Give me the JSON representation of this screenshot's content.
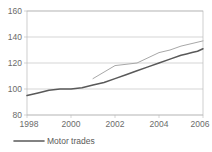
{
  "chart_data": {
    "type": "line",
    "title": "",
    "xlabel": "",
    "ylabel": "",
    "xlim": [
      1998,
      2006
    ],
    "ylim": [
      80,
      160
    ],
    "grid": true,
    "legend_position": "bottom-left",
    "y_ticks": [
      "80",
      "100",
      "120",
      "140",
      "160"
    ],
    "x_ticks": [
      "1998",
      "2000",
      "2002",
      "2004",
      "2006"
    ],
    "series": [
      {
        "name": "Motor trades",
        "color": "#595959",
        "in_legend": true,
        "x": [
          1998,
          1998.5,
          1999,
          1999.5,
          2000,
          2000.5,
          2001,
          2001.5,
          2002,
          2002.5,
          2003,
          2003.5,
          2004,
          2004.5,
          2005,
          2005.25,
          2005.5,
          2005.75,
          2006
        ],
        "values": [
          95,
          97,
          99,
          100,
          100,
          101,
          103,
          105,
          108,
          111,
          114,
          117,
          120,
          123,
          126,
          127,
          128,
          129,
          131
        ]
      },
      {
        "name": "",
        "color": "#a8a8a8",
        "in_legend": false,
        "x": [
          2001,
          2001.5,
          2002,
          2002.5,
          2003,
          2003.5,
          2004,
          2004.5,
          2005,
          2005.5,
          2006
        ],
        "values": [
          108,
          113,
          118,
          119,
          120,
          124,
          128,
          130,
          133,
          135,
          137
        ]
      }
    ]
  },
  "legend": {
    "entries": [
      {
        "label": "Motor trades",
        "color": "#595959"
      }
    ]
  }
}
